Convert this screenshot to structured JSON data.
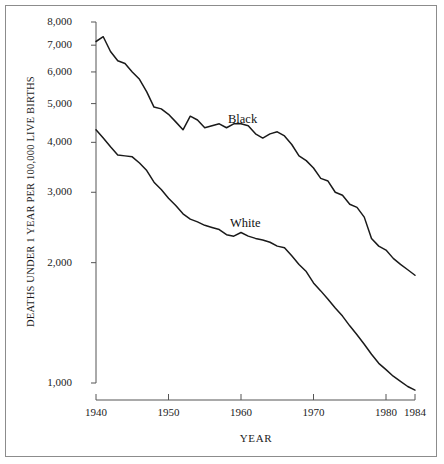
{
  "figure": {
    "background_color": "#ffffff",
    "border_color": "#8c8c8c",
    "line_color": "#1a1a1a",
    "axis_color": "#555555",
    "text_color": "#1c1c1c"
  },
  "chart_data": {
    "type": "line",
    "title": "",
    "subtitle": "",
    "xlabel": "YEAR",
    "ylabel": "DEATHS UNDER 1 YEAR PER 100,000 LIVE BIRTHS",
    "yscale": "log",
    "ylim": [
      1000,
      8000
    ],
    "xlim": [
      1940,
      1984
    ],
    "grid": false,
    "legend_position": "inline-annotation",
    "x_tick_labels": [
      "1940",
      "1950",
      "1960",
      "1970",
      "1980",
      "1984"
    ],
    "x_tick_values": [
      1940,
      1950,
      1960,
      1970,
      1980,
      1984
    ],
    "y_tick_labels": [
      "8,000",
      "7,000",
      "6,000",
      "5,000",
      "4,000",
      "3,000",
      "2,000",
      "1,000"
    ],
    "y_tick_values": [
      8000,
      7000,
      6000,
      5000,
      4000,
      3000,
      2000,
      1000
    ],
    "x": [
      1940,
      1941,
      1942,
      1943,
      1944,
      1945,
      1946,
      1947,
      1948,
      1949,
      1950,
      1951,
      1952,
      1953,
      1954,
      1955,
      1956,
      1957,
      1958,
      1959,
      1960,
      1961,
      1962,
      1963,
      1964,
      1965,
      1966,
      1967,
      1968,
      1969,
      1970,
      1971,
      1972,
      1973,
      1974,
      1975,
      1976,
      1977,
      1978,
      1979,
      1980,
      1981,
      1982,
      1983,
      1984
    ],
    "series": [
      {
        "name": "Black",
        "label": "Black",
        "values": [
          7150,
          7350,
          6750,
          6400,
          6300,
          6000,
          5750,
          5350,
          4900,
          4850,
          4700,
          4500,
          4300,
          4650,
          4550,
          4350,
          4400,
          4450,
          4350,
          4450,
          4450,
          4400,
          4200,
          4100,
          4200,
          4250,
          4150,
          3950,
          3700,
          3600,
          3450,
          3250,
          3200,
          3000,
          2950,
          2800,
          2750,
          2600,
          2300,
          2200,
          2150,
          2050,
          1980,
          1920,
          1860
        ]
      },
      {
        "name": "White",
        "label": "White",
        "values": [
          4300,
          4100,
          3900,
          3720,
          3700,
          3680,
          3550,
          3400,
          3180,
          3050,
          2900,
          2780,
          2650,
          2570,
          2530,
          2480,
          2450,
          2420,
          2350,
          2330,
          2380,
          2330,
          2300,
          2280,
          2250,
          2200,
          2180,
          2080,
          1980,
          1900,
          1780,
          1700,
          1620,
          1540,
          1470,
          1390,
          1320,
          1250,
          1180,
          1120,
          1080,
          1040,
          1010,
          980,
          960
        ]
      }
    ]
  },
  "labels": {
    "black": "Black",
    "white": "White",
    "x_axis_title": "YEAR",
    "y_axis_title": "DEATHS UNDER 1 YEAR PER 100,000 LIVE BIRTHS"
  }
}
